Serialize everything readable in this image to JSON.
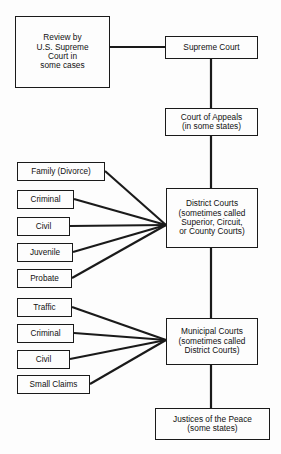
{
  "diagram": {
    "background_color": "#fdfdfd",
    "line_color": "#1a1a1a",
    "text_color": "#111111",
    "nodes": {
      "review": "Review by\nU.S. Supreme\nCourt in\nsome cases",
      "supreme": "Supreme Court",
      "appeals": "Court of Appeals\n(in some states)",
      "district": "District Courts\n(sometimes called\nSuperior, Circuit,\nor County Courts)",
      "municipal": "Municipal Courts\n(sometimes called\nDistrict Courts)",
      "justices": "Justices of the Peace\n(some states)",
      "family": "Family (Divorce)",
      "criminal_district": "Criminal",
      "civil_district": "Civil",
      "juvenile": "Juvenile",
      "probate": "Probate",
      "traffic": "Traffic",
      "criminal_municipal": "Criminal",
      "civil_municipal": "Civil",
      "small_claims": "Small Claims"
    },
    "edges": [
      {
        "from": "review",
        "to": "supreme",
        "style": "elbow"
      },
      {
        "from": "supreme",
        "to": "appeals",
        "style": "vertical"
      },
      {
        "from": "appeals",
        "to": "district",
        "style": "vertical"
      },
      {
        "from": "district",
        "to": "municipal",
        "style": "vertical"
      },
      {
        "from": "municipal",
        "to": "justices",
        "style": "vertical"
      },
      {
        "from": "family",
        "to": "district",
        "style": "diagonal"
      },
      {
        "from": "criminal_district",
        "to": "district",
        "style": "diagonal"
      },
      {
        "from": "civil_district",
        "to": "district",
        "style": "horizontal"
      },
      {
        "from": "juvenile",
        "to": "district",
        "style": "diagonal"
      },
      {
        "from": "probate",
        "to": "district",
        "style": "diagonal"
      },
      {
        "from": "traffic",
        "to": "municipal",
        "style": "diagonal"
      },
      {
        "from": "criminal_municipal",
        "to": "municipal",
        "style": "diagonal"
      },
      {
        "from": "civil_municipal",
        "to": "municipal",
        "style": "diagonal"
      },
      {
        "from": "small_claims",
        "to": "municipal",
        "style": "diagonal"
      }
    ]
  }
}
